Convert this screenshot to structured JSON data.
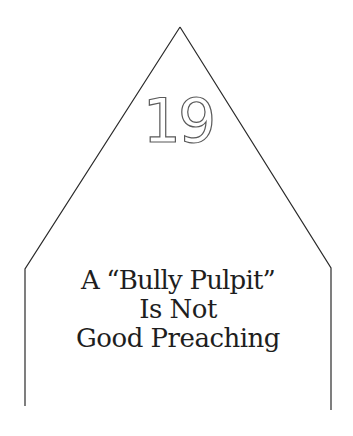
{
  "chapter": {
    "number": "19"
  },
  "title": {
    "lines": [
      "A “Bully Pulpit”",
      "Is Not",
      "Good Preaching"
    ]
  },
  "colors": {
    "background": "#ffffff",
    "frame_stroke": "#2a2a2a",
    "number_outline": "#5a5a5a",
    "text": "#1e1e1e"
  }
}
